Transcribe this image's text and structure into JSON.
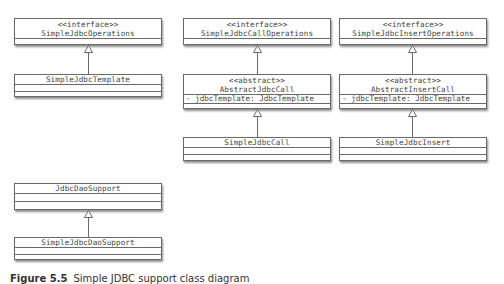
{
  "diagram": {
    "type": "uml-class-diagram",
    "classes": {
      "simple_jdbc_operations": {
        "stereotype": "<<interface>>",
        "name": "SimpleJdbcOperations"
      },
      "simple_jdbc_template": {
        "name": "SimpleJdbcTemplate"
      },
      "simple_jdbc_call_operations": {
        "stereotype": "<<interface>>",
        "name": "SimpleJdbcCallOperations"
      },
      "abstract_jdbc_call": {
        "stereotype": "<<abstract>>",
        "name": "AbstractJdbcCall",
        "attribute": "- jdbcTemplate: JdbcTemplate"
      },
      "simple_jdbc_call": {
        "name": "SimpleJdbcCall"
      },
      "simple_jdbc_insert_operations": {
        "stereotype": "<<interface>>",
        "name": "SimpleJdbcInsertOperations"
      },
      "abstract_insert_call": {
        "stereotype": "<<abstract>>",
        "name": "AbstractInsertCall",
        "attribute": "- jdbcTemplate: JdbcTemplate"
      },
      "simple_jdbc_insert": {
        "name": "SimpleJdbcInsert"
      },
      "jdbc_dao_support": {
        "name": "JdbcDaoSupport"
      },
      "simple_jdbc_dao_support": {
        "name": "SimpleJdbcDaoSupport"
      }
    },
    "relations": [
      {
        "from": "SimpleJdbcTemplate",
        "to": "SimpleJdbcOperations",
        "kind": "realization"
      },
      {
        "from": "AbstractJdbcCall",
        "to": "SimpleJdbcCallOperations",
        "kind": "realization"
      },
      {
        "from": "SimpleJdbcCall",
        "to": "AbstractJdbcCall",
        "kind": "generalization"
      },
      {
        "from": "AbstractInsertCall",
        "to": "SimpleJdbcInsertOperations",
        "kind": "realization"
      },
      {
        "from": "SimpleJdbcInsert",
        "to": "AbstractInsertCall",
        "kind": "generalization"
      },
      {
        "from": "SimpleJdbcDaoSupport",
        "to": "JdbcDaoSupport",
        "kind": "generalization"
      }
    ],
    "colors": {
      "line": "#6a6a6a",
      "text": "#444444",
      "background": "#ffffff"
    }
  },
  "caption": {
    "figure": "Figure 5.5",
    "text": "Simple JDBC support class diagram"
  }
}
